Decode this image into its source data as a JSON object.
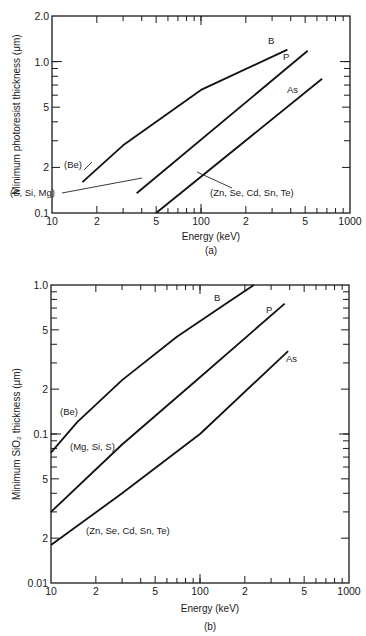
{
  "chart_data": [
    {
      "id": "a",
      "type": "line",
      "caption": "(a)",
      "title": "",
      "xlabel": "Energy (keV)",
      "ylabel": "Minimum photoresist thickness (μm)",
      "xscale": "log",
      "yscale": "log",
      "xlim": [
        10,
        1000
      ],
      "ylim": [
        0.1,
        2.0
      ],
      "x_tick_labels": [
        {
          "value": 10,
          "label": "10"
        },
        {
          "value": 20,
          "label": "2"
        },
        {
          "value": 50,
          "label": "5"
        },
        {
          "value": 100,
          "label": "100"
        },
        {
          "value": 200,
          "label": "2"
        },
        {
          "value": 500,
          "label": "5"
        },
        {
          "value": 1000,
          "label": "1000"
        }
      ],
      "y_tick_labels": [
        {
          "value": 0.1,
          "label": "0.1"
        },
        {
          "value": 0.2,
          "label": "2"
        },
        {
          "value": 0.5,
          "label": "5"
        },
        {
          "value": 1.0,
          "label": "1.0"
        },
        {
          "value": 2.0,
          "label": "2.0"
        }
      ],
      "grid": false,
      "series": [
        {
          "name": "B",
          "group_label": "(Be)",
          "x": [
            16,
            30,
            100,
            380
          ],
          "y": [
            0.16,
            0.28,
            0.65,
            1.2
          ]
        },
        {
          "name": "P",
          "group_label": "(S, Si, Mg)",
          "x": [
            37,
            520
          ],
          "y": [
            0.135,
            1.18
          ]
        },
        {
          "name": "As",
          "group_label": "(Zn, Se, Cd, Sn, Te)",
          "x": [
            50,
            650
          ],
          "y": [
            0.1,
            0.77
          ]
        }
      ]
    },
    {
      "id": "b",
      "type": "line",
      "caption": "(b)",
      "title": "",
      "xlabel": "Energy (keV)",
      "ylabel": "Minimum SiO₂ thickness (μm)",
      "xscale": "log",
      "yscale": "log",
      "xlim": [
        10,
        1000
      ],
      "ylim": [
        0.01,
        1.0
      ],
      "x_tick_labels": [
        {
          "value": 10,
          "label": "10"
        },
        {
          "value": 20,
          "label": "2"
        },
        {
          "value": 50,
          "label": "5"
        },
        {
          "value": 100,
          "label": "100"
        },
        {
          "value": 200,
          "label": "2"
        },
        {
          "value": 500,
          "label": "5"
        },
        {
          "value": 1000,
          "label": "1000"
        }
      ],
      "y_tick_labels": [
        {
          "value": 0.01,
          "label": "0.01"
        },
        {
          "value": 0.02,
          "label": "2"
        },
        {
          "value": 0.05,
          "label": "5"
        },
        {
          "value": 0.1,
          "label": "0.1"
        },
        {
          "value": 0.2,
          "label": "2"
        },
        {
          "value": 0.5,
          "label": "5"
        },
        {
          "value": 1.0,
          "label": "1.0"
        }
      ],
      "grid": false,
      "series": [
        {
          "name": "B",
          "group_label": "(Be)",
          "x": [
            10,
            15,
            30,
            70,
            150,
            230
          ],
          "y": [
            0.075,
            0.12,
            0.23,
            0.45,
            0.75,
            1.0
          ]
        },
        {
          "name": "P",
          "group_label": "(Mg, Si, S)",
          "x": [
            10,
            30,
            100,
            370
          ],
          "y": [
            0.03,
            0.085,
            0.24,
            0.75
          ]
        },
        {
          "name": "As",
          "group_label": "(Zn, Se, Cd, Sn, Te)",
          "x": [
            10,
            30,
            100,
            390
          ],
          "y": [
            0.018,
            0.04,
            0.1,
            0.36
          ]
        }
      ]
    }
  ]
}
